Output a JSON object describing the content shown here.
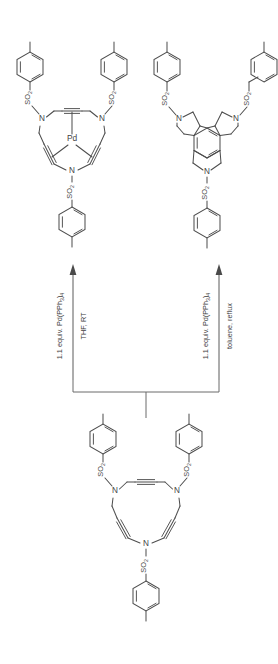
{
  "diagram": {
    "kind": "chemical-reaction-scheme",
    "background_color": "#ffffff",
    "line_color": "#4d4d4d",
    "text_color": "#4a4a4a",
    "orientation": "bottom-to-top, single substrate branching to two products"
  },
  "labels": {
    "nitrogen": "N",
    "palladium": "Pd",
    "sulfonyl": "SO",
    "sulfonyl_subscript": "2"
  },
  "arrows": {
    "left": {
      "reagent": "1.1 equiv. Pd(PPh",
      "reagent_sub1": "3",
      "reagent_tail": ")",
      "reagent_sub2": "4",
      "reagent_full": "1.1 equiv. Pd(PPh3)4",
      "conditions": "THF, RT",
      "direction": "up"
    },
    "right": {
      "reagent": "1.1 equiv. Pd(PPh",
      "reagent_sub1": "3",
      "reagent_tail": ")",
      "reagent_sub2": "4",
      "reagent_full": "1.1 equiv. Pd(PPh3)4",
      "conditions": "toluene, reflux",
      "direction": "up"
    }
  },
  "structures": {
    "starting_material": {
      "name": "tris(N-tosyl) azamacrocyclic triyne",
      "ring_nitrogens": 3,
      "alkynes": 3,
      "tosyl_groups": 3,
      "position": "bottom-center"
    },
    "product_left": {
      "name": "Pd(0) tris-alkyne macrocycle complex",
      "metal": "Pd",
      "metal_bonds": 3,
      "ring_nitrogens": 3,
      "alkynes": 3,
      "tosyl_groups": 3,
      "position": "top-left"
    },
    "product_right": {
      "name": "tris-fused arene (triple cyclotrimerized benzene core)",
      "aromatic_core": "benzene",
      "fused_rings": 3,
      "ring_nitrogens": 3,
      "tosyl_groups": 3,
      "position": "top-right",
      "clipped_at_right_edge": true
    }
  },
  "substituents": {
    "aryl_group": "p-tolyl (4-methylphenyl)",
    "linker": "sulfonyl (SO2)"
  }
}
